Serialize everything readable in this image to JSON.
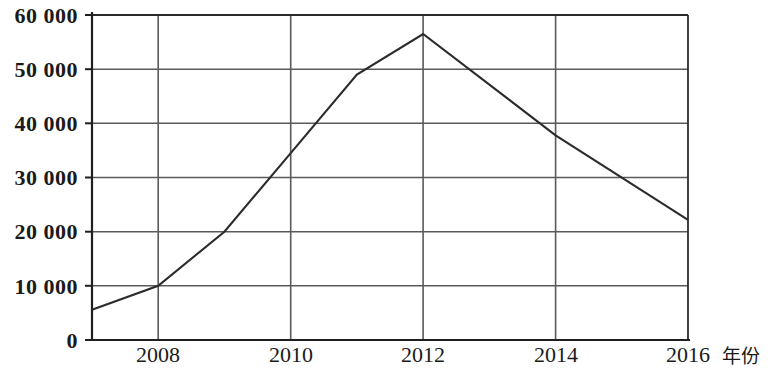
{
  "chart_data": {
    "type": "line",
    "title": "",
    "xlabel": "年份",
    "ylabel": "",
    "x": [
      2007,
      2008,
      2009,
      2010,
      2011,
      2012,
      2014,
      2016
    ],
    "values": [
      5600,
      10000,
      20000,
      34500,
      49000,
      56500,
      37800,
      22200
    ],
    "series": [
      {
        "name": "",
        "x": [
          2007,
          2008,
          2009,
          2010,
          2011,
          2012,
          2014,
          2016
        ],
        "values": [
          5600,
          10000,
          20000,
          34500,
          49000,
          56500,
          37800,
          22200
        ]
      }
    ],
    "xlim": [
      2007,
      2016
    ],
    "ylim": [
      0,
      60000
    ],
    "xticks": [
      2008,
      2010,
      2012,
      2014,
      2016
    ],
    "xtick_labels": [
      "2008",
      "2010",
      "2012",
      "2014",
      "2016"
    ],
    "yticks": [
      0,
      10000,
      20000,
      30000,
      40000,
      50000,
      60000
    ],
    "ytick_labels": [
      "0",
      "10 000",
      "20 000",
      "30 000",
      "40 000",
      "50 000",
      "60 000"
    ],
    "grid": true,
    "grid_x": true,
    "grid_y": true,
    "legend": false,
    "legend_position": "none",
    "line_color": "#2b2b2b",
    "grid_color": "#555555",
    "axis_color": "#2b2b2b",
    "background_color": "#ffffff",
    "markers": false
  },
  "axis": {
    "x_unit_label": "年份"
  }
}
